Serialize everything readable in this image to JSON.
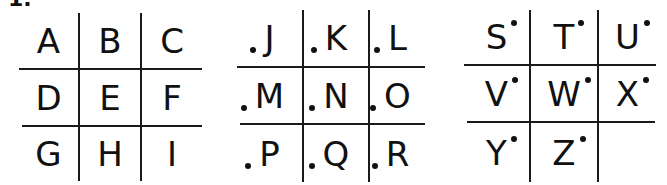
{
  "label": "1.",
  "grids": [
    {
      "name": "grid-plain",
      "dot": "none",
      "cells": [
        "A",
        "B",
        "C",
        "D",
        "E",
        "F",
        "G",
        "H",
        "I"
      ]
    },
    {
      "name": "grid-dot-left",
      "dot": "bottom-left",
      "cells": [
        "J",
        "K",
        "L",
        "M",
        "N",
        "O",
        "P",
        "Q",
        "R"
      ]
    },
    {
      "name": "grid-dot-right",
      "dot": "top-right",
      "cells": [
        "S",
        "T",
        "U",
        "V",
        "W",
        "X",
        "Y",
        "Z",
        ""
      ]
    }
  ],
  "colors": {
    "ink": "#111111",
    "background": "#ffffff"
  }
}
